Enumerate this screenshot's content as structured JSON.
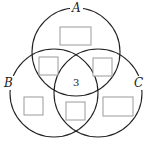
{
  "diagram": {
    "type": "venn-3-sets",
    "sets": [
      {
        "id": "A",
        "label": "A",
        "cx": 76,
        "cy": 52,
        "r": 44
      },
      {
        "id": "B",
        "label": "B",
        "cx": 54,
        "cy": 93,
        "r": 44
      },
      {
        "id": "C",
        "label": "C",
        "cx": 98,
        "cy": 93,
        "r": 44
      }
    ],
    "regions": {
      "A_only": {
        "value": "",
        "box": true
      },
      "A_and_B_only": {
        "value": "",
        "box": true
      },
      "A_and_C_only": {
        "value": "",
        "box": true
      },
      "A_B_C": {
        "value": "3",
        "box": false
      },
      "B_only": {
        "value": "",
        "box": true
      },
      "B_and_C_only": {
        "value": "",
        "box": true
      },
      "C_only": {
        "value": "",
        "box": true
      }
    },
    "colors": {
      "circle_stroke": "#222222",
      "box_stroke": "#9a9a9a",
      "background": "#ffffff"
    }
  }
}
